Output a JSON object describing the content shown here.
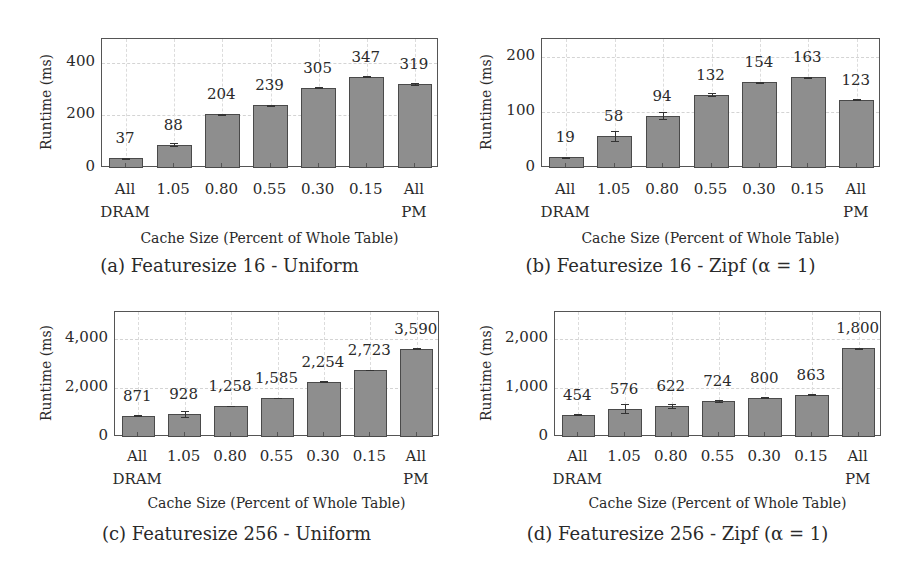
{
  "figure": {
    "panels": [
      {
        "id": "a",
        "caption": "(a) Featuresize 16 - Uniform"
      },
      {
        "id": "b",
        "caption": "(b) Featuresize 16 - Zipf (α = 1)"
      },
      {
        "id": "c",
        "caption": "(c) Featuresize 256 - Uniform"
      },
      {
        "id": "d",
        "caption": "(d) Featuresize 256 - Zipf (α = 1)"
      }
    ],
    "colors": {
      "bar_fill": "#8e8e8e",
      "bar_edge": "#4a4a4a",
      "frame": "#555555"
    }
  },
  "chart_data": [
    {
      "type": "bar",
      "title": "(a) Featuresize 16 - Uniform",
      "xlabel": "Cache Size (Percent of Whole Table)",
      "ylabel": "Runtime (ms)",
      "categories": [
        "All DRAM",
        "1.05",
        "0.80",
        "0.55",
        "0.30",
        "0.15",
        "All PM"
      ],
      "category_lines": [
        [
          "All",
          "DRAM"
        ],
        [
          "1.05",
          ""
        ],
        [
          "0.80",
          ""
        ],
        [
          "0.55",
          ""
        ],
        [
          "0.30",
          ""
        ],
        [
          "0.15",
          ""
        ],
        [
          "All",
          "PM"
        ]
      ],
      "values": [
        37,
        88,
        204,
        239,
        305,
        347,
        319
      ],
      "value_labels": [
        "37",
        "88",
        "204",
        "239",
        "305",
        "347",
        "319"
      ],
      "errors": [
        2,
        6,
        2,
        2,
        2,
        2,
        2
      ],
      "yticks": [
        0,
        200,
        400
      ],
      "ytick_labels": [
        "0",
        "200",
        "400"
      ],
      "ylim": [
        0,
        490
      ],
      "grid": true
    },
    {
      "type": "bar",
      "title": "(b) Featuresize 16 - Zipf (α = 1)",
      "xlabel": "Cache Size (Percent of Whole Table)",
      "ylabel": "Runtime (ms)",
      "categories": [
        "All DRAM",
        "1.05",
        "0.80",
        "0.55",
        "0.30",
        "0.15",
        "All PM"
      ],
      "category_lines": [
        [
          "All",
          "DRAM"
        ],
        [
          "1.05",
          ""
        ],
        [
          "0.80",
          ""
        ],
        [
          "0.55",
          ""
        ],
        [
          "0.30",
          ""
        ],
        [
          "0.15",
          ""
        ],
        [
          "All",
          "PM"
        ]
      ],
      "values": [
        19,
        58,
        94,
        132,
        154,
        163,
        123
      ],
      "value_labels": [
        "19",
        "58",
        "94",
        "132",
        "154",
        "163",
        "123"
      ],
      "errors": [
        1,
        9,
        6,
        3,
        1,
        1,
        1
      ],
      "yticks": [
        0,
        100,
        200
      ],
      "ytick_labels": [
        "0",
        "100",
        "200"
      ],
      "ylim": [
        0,
        232
      ],
      "grid": true
    },
    {
      "type": "bar",
      "title": "(c) Featuresize 256 - Uniform",
      "xlabel": "Cache Size (Percent of Whole Table)",
      "ylabel": "Runtime (ms)",
      "categories": [
        "All DRAM",
        "1.05",
        "0.80",
        "0.55",
        "0.30",
        "0.15",
        "All PM"
      ],
      "category_lines": [
        [
          "All",
          "DRAM"
        ],
        [
          "1.05",
          ""
        ],
        [
          "0.80",
          ""
        ],
        [
          "0.55",
          ""
        ],
        [
          "0.30",
          ""
        ],
        [
          "0.15",
          ""
        ],
        [
          "All",
          "PM"
        ]
      ],
      "values": [
        871,
        928,
        1258,
        1585,
        2254,
        2723,
        3590
      ],
      "value_labels": [
        "871",
        "928",
        "1,258",
        "1,585",
        "2,254",
        "2,723",
        "3,590"
      ],
      "errors": [
        10,
        110,
        10,
        10,
        10,
        10,
        30
      ],
      "yticks": [
        0,
        2000,
        4000
      ],
      "ytick_labels": [
        "0",
        "2,000",
        "4,000"
      ],
      "ylim": [
        0,
        5080
      ],
      "grid": true
    },
    {
      "type": "bar",
      "title": "(d) Featuresize 256 - Zipf (α = 1)",
      "xlabel": "Cache Size (Percent of Whole Table)",
      "ylabel": "Runtime (ms)",
      "categories": [
        "All DRAM",
        "1.05",
        "0.80",
        "0.55",
        "0.30",
        "0.15",
        "All PM"
      ],
      "category_lines": [
        [
          "All",
          "DRAM"
        ],
        [
          "1.05",
          ""
        ],
        [
          "0.80",
          ""
        ],
        [
          "0.55",
          ""
        ],
        [
          "0.30",
          ""
        ],
        [
          "0.15",
          ""
        ],
        [
          "All",
          "PM"
        ]
      ],
      "values": [
        454,
        576,
        622,
        724,
        800,
        863,
        1800
      ],
      "value_labels": [
        "454",
        "576",
        "622",
        "724",
        "800",
        "863",
        "1,800"
      ],
      "errors": [
        5,
        90,
        40,
        20,
        5,
        5,
        10
      ],
      "yticks": [
        0,
        1000,
        2000
      ],
      "ytick_labels": [
        "0",
        "1,000",
        "2,000"
      ],
      "ylim": [
        0,
        2540
      ],
      "grid": true
    }
  ]
}
